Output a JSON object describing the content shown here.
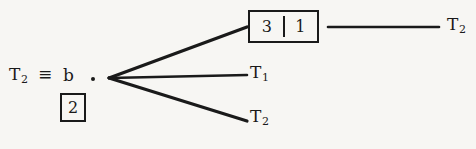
{
  "figure": {
    "type": "derivation-tree-diagram",
    "background_color": "#f7f6f3",
    "ink_color": "#1a1a1a"
  },
  "left_expression": {
    "term_label": "T",
    "term_subscript": "2",
    "equivalence_symbol": "≡",
    "variable": "b",
    "index_box_value": "2",
    "junction_dot": "·"
  },
  "state_box": {
    "left_value": "3",
    "right_value": "1",
    "divider": "|"
  },
  "branches": [
    {
      "name": "upper-branch",
      "target": "state-box",
      "label": "",
      "subscript": ""
    },
    {
      "name": "middle-branch",
      "target": "T1",
      "label": "T",
      "subscript": "1"
    },
    {
      "name": "lower-branch",
      "target": "T2",
      "label": "T",
      "subscript": "2"
    }
  ],
  "continuation": {
    "label": "T",
    "subscript": "2"
  }
}
